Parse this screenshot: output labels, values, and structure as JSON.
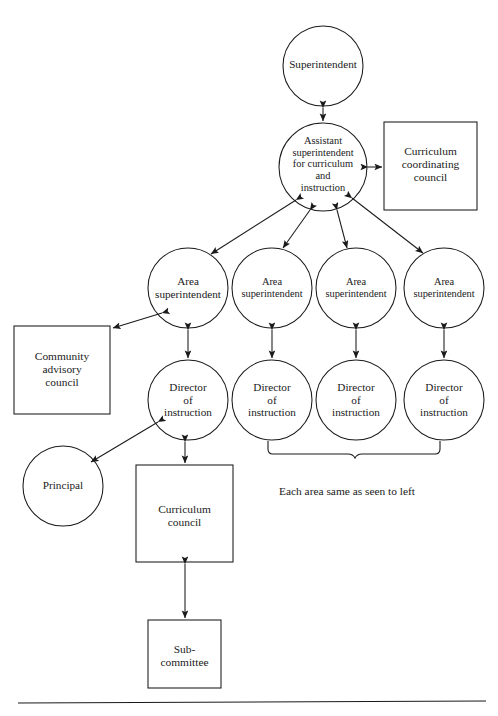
{
  "diagram": {
    "caption": "Each area same as seen to left",
    "stroke_color": "#1a1a1a",
    "background_color": "#ffffff",
    "nodes": {
      "superintendent": {
        "label": "Superintendent",
        "shape": "circle"
      },
      "assistant_superintendent": {
        "label": "Assistant\nsuperintendent\nfor curriculum\nand\ninstruction",
        "shape": "circle"
      },
      "curriculum_coordinating_council": {
        "label": "Curriculum\ncoordinating\ncouncil",
        "shape": "box"
      },
      "area_superintendent_1": {
        "label": "Area\nsuperintendent",
        "shape": "circle"
      },
      "area_superintendent_2": {
        "label": "Area\nsuperintendent",
        "shape": "circle"
      },
      "area_superintendent_3": {
        "label": "Area\nsuperintendent",
        "shape": "circle"
      },
      "area_superintendent_4": {
        "label": "Area\nsuperintendent",
        "shape": "circle"
      },
      "director_of_instruction_1": {
        "label": "Director\nof\ninstruction",
        "shape": "circle"
      },
      "director_of_instruction_2": {
        "label": "Director\nof\ninstruction",
        "shape": "circle"
      },
      "director_of_instruction_3": {
        "label": "Director\nof\ninstruction",
        "shape": "circle"
      },
      "director_of_instruction_4": {
        "label": "Director\nof\ninstruction",
        "shape": "circle"
      },
      "community_advisory_council": {
        "label": "Community\nadvisory\ncouncil",
        "shape": "box"
      },
      "principal": {
        "label": "Principal",
        "shape": "circle"
      },
      "curriculum_council": {
        "label": "Curriculum\ncouncil",
        "shape": "box"
      },
      "sub_committee": {
        "label": "Sub-\ncommittee",
        "shape": "box"
      }
    },
    "lines": [
      {
        "name": "superintendent-to-assistant",
        "type": "double-arrow"
      },
      {
        "name": "assistant-to-curriculum-coordinating-council",
        "type": "double-arrow"
      },
      {
        "name": "assistant-to-area-superintendent-1",
        "type": "double-arrow"
      },
      {
        "name": "assistant-to-area-superintendent-2",
        "type": "double-arrow"
      },
      {
        "name": "assistant-to-area-superintendent-3",
        "type": "double-arrow"
      },
      {
        "name": "assistant-to-area-superintendent-4",
        "type": "double-arrow"
      },
      {
        "name": "area-1-to-director-1",
        "type": "double-arrow"
      },
      {
        "name": "area-2-to-director-2",
        "type": "double-arrow"
      },
      {
        "name": "area-3-to-director-3",
        "type": "double-arrow"
      },
      {
        "name": "area-4-to-director-4",
        "type": "double-arrow"
      },
      {
        "name": "area-1-to-community-advisory-council",
        "type": "double-arrow"
      },
      {
        "name": "director-1-to-principal",
        "type": "double-arrow"
      },
      {
        "name": "director-1-to-curriculum-council",
        "type": "double-arrow"
      },
      {
        "name": "curriculum-council-to-sub-committee",
        "type": "double-arrow"
      },
      {
        "name": "brace-under-right-directors",
        "type": "brace"
      }
    ]
  }
}
